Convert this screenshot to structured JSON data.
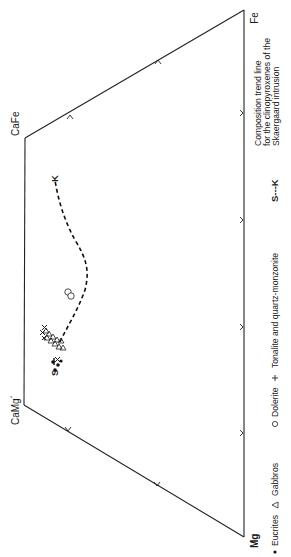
{
  "diagram": {
    "type": "pyroxene quadrilateral (rotated 90°)",
    "vertices": {
      "fe": "Fe",
      "cafe": "CaFe",
      "camg": "CaMg´",
      "mg": "Mg"
    },
    "trend_line": {
      "start_label": "S",
      "end_label": "K",
      "key": "S---K",
      "description": "Composition trend line for the clinopyroxenes of the Skaergaard intrusion",
      "description_lines": [
        "Composition trend line",
        "for the clinopyroxenes of the",
        "Skaergaard intrusion"
      ]
    },
    "legend": [
      {
        "symbol": "filled-dot",
        "glyph": "•",
        "label": "Eucrites"
      },
      {
        "symbol": "open-triangle",
        "glyph": "△",
        "label": "Gabbros"
      },
      {
        "symbol": "open-circle",
        "glyph": "○",
        "label": "Dolerite"
      },
      {
        "symbol": "plus",
        "glyph": "+",
        "label": "Tonalite and quartz-monzonite"
      }
    ],
    "data_groups": {
      "eucrites": {
        "symbol": "filled-dot",
        "count": 4
      },
      "gabbros": {
        "symbol": "open-triangle",
        "count": 10
      },
      "dolerite": {
        "symbol": "open-circle",
        "count": 2
      },
      "tonalite_quartz_monzonite": {
        "symbol": "plus",
        "count": 4
      }
    },
    "colors": {
      "ink": "#1a1a1a",
      "background": "#ffffff"
    }
  }
}
